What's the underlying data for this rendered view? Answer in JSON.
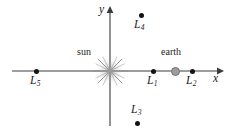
{
  "figure": {
    "type": "lagrange-points-diagram",
    "width": 230,
    "height": 136,
    "background": "#ffffff"
  },
  "axes": {
    "x_label": "x",
    "y_label": "y",
    "x_line": {
      "x1": 12,
      "y1": 71,
      "x2": 218,
      "y2": 71
    },
    "y_line": {
      "x1": 110,
      "y1": 125,
      "x2": 110,
      "y2": 12
    },
    "x_label_pos": {
      "x": 213,
      "y": 73
    },
    "y_label_pos": {
      "x": 99,
      "y": 4
    },
    "color": "#3c3c3c",
    "origin": {
      "x": 110,
      "y": 71
    }
  },
  "bodies": [
    {
      "id": "sun",
      "label": "sun",
      "x": 110,
      "y": 71,
      "label_x": 77,
      "label_y": 47,
      "glyph": "starburst",
      "color": "#9a9a9a",
      "radius": 16
    },
    {
      "id": "earth",
      "label": "earth",
      "x": 175,
      "y": 71,
      "label_x": 161,
      "label_y": 47,
      "glyph": "filled-circle",
      "color": "#9d9d9d",
      "border": "#6f6f6f",
      "radius": 4.5
    }
  ],
  "points": [
    {
      "id": "L5",
      "letter": "L",
      "sub": "5",
      "x": 36,
      "y": 71,
      "label_x": 30,
      "label_y": 75
    },
    {
      "id": "L1",
      "letter": "L",
      "sub": "1",
      "x": 153,
      "y": 71,
      "label_x": 147,
      "label_y": 75
    },
    {
      "id": "L2",
      "letter": "L",
      "sub": "2",
      "x": 192,
      "y": 71,
      "label_x": 186,
      "label_y": 75
    },
    {
      "id": "L4",
      "letter": "L",
      "sub": "4",
      "x": 141,
      "y": 15,
      "label_x": 134,
      "label_y": 19
    },
    {
      "id": "L3",
      "letter": "L",
      "sub": "3",
      "x": 137,
      "y": 123,
      "label_x": 131,
      "label_y": 104
    }
  ],
  "colors": {
    "axis": "#3c3c3c",
    "point": "#131313",
    "text": "#1a1a1a",
    "sun": "#9a9a9a",
    "earth": "#9d9d9d"
  }
}
